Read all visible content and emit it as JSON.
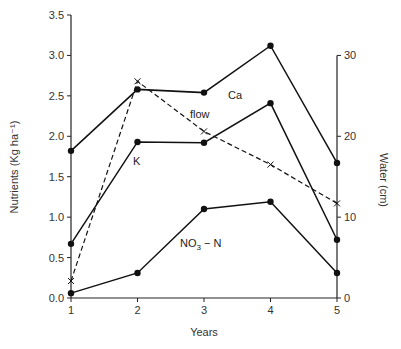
{
  "chart_data": {
    "type": "line",
    "title": "",
    "xlabel": "Years",
    "ylabel": "Nutrients (Kg ha⁻¹)",
    "y2label": "Water (cm)",
    "x": [
      1,
      2,
      3,
      4,
      5
    ],
    "xticks": [
      "1",
      "2",
      "3",
      "4",
      "5"
    ],
    "ylim": [
      0,
      3.5
    ],
    "yticks": [
      "0.0",
      "0.5",
      "1.0",
      "1.5",
      "2.0",
      "2.5",
      "3.0",
      "3.5"
    ],
    "y2lim": [
      0,
      35
    ],
    "y2ticks": [
      "0",
      "10",
      "20",
      "30"
    ],
    "grid": false,
    "legend": "inline labels",
    "series": [
      {
        "name": "Ca",
        "axis": "left",
        "style": "solid",
        "marker": "dot",
        "values": [
          1.82,
          2.58,
          2.54,
          3.12,
          1.67
        ],
        "label_pos": [
          228,
          99
        ]
      },
      {
        "name": "K",
        "axis": "left",
        "style": "solid",
        "marker": "dot",
        "values": [
          0.67,
          1.93,
          1.92,
          2.41,
          0.72
        ],
        "label_pos": [
          135,
          164
        ]
      },
      {
        "name": "NO3 - N",
        "axis": "left",
        "style": "solid",
        "marker": "dot",
        "values": [
          0.06,
          0.31,
          1.1,
          1.19,
          0.31
        ],
        "label_pos": [
          180,
          248
        ]
      },
      {
        "name": "flow",
        "axis": "right",
        "style": "dashed",
        "marker": "cross",
        "values": [
          2.1,
          26.8,
          20.6,
          16.5,
          11.7
        ],
        "label_pos": [
          190,
          118
        ]
      }
    ]
  },
  "labels": {
    "x_title": "Years",
    "y_title": "Nutrients (Kg ha⁻¹)",
    "y2_title": "Water (cm)",
    "ca": "Ca",
    "k": "K",
    "no3": "NO",
    "no3_sub": "3",
    "no3_rest": " − N",
    "flow": "flow"
  }
}
